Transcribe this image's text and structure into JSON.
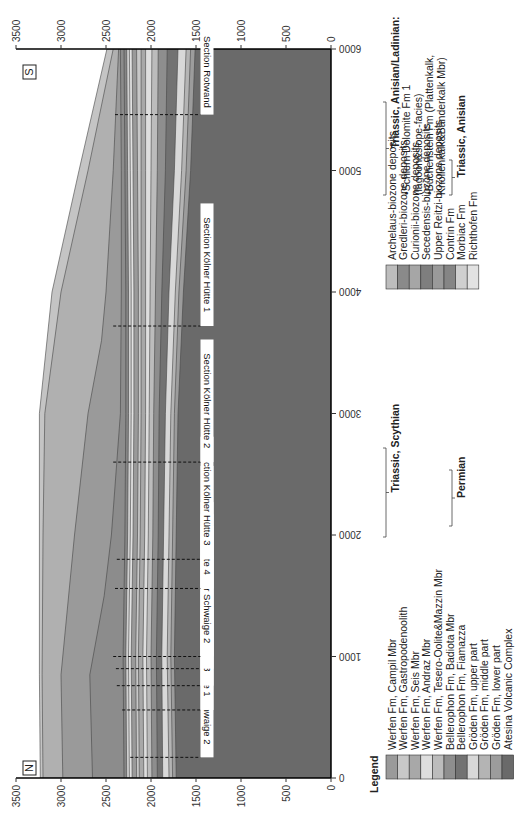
{
  "chart_data": {
    "type": "area",
    "title": "",
    "orientation": "rotated 90 degrees (figure printed sideways)",
    "xlabel": "",
    "ylabel": "",
    "x_axis": {
      "name": "distance",
      "range": [
        0,
        6000
      ],
      "ticks": [
        0,
        1000,
        2000,
        3000,
        4000,
        5000,
        6000
      ]
    },
    "y_axis": {
      "name": "elevation",
      "range": [
        0,
        3500
      ],
      "ticks": [
        0,
        500,
        1000,
        1500,
        2000,
        2500,
        3000,
        3500
      ]
    },
    "compass": {
      "left_end": "N",
      "right_end": "S"
    },
    "grid": false,
    "sections": [
      {
        "label": "Section Hanicker Schwaige 2",
        "x": 170,
        "top_elev": 2230
      },
      {
        "label": "Section Völsecker Schwaige 1",
        "x": 560,
        "top_elev": 2320
      },
      {
        "label": "Section Hanicker Schwaige 1/3",
        "x": 760,
        "top_elev": 2380
      },
      {
        "label": "Section Völsecker Schwaige 3",
        "x": 900,
        "top_elev": 2390
      },
      {
        "label": "Section Völsecker Schwaige 2",
        "x": 1000,
        "top_elev": 2420
      },
      {
        "label": "Section Kölner Hütte 4",
        "x": 1560,
        "top_elev": 2400
      },
      {
        "label": "Section Kölner Hütte 3",
        "x": 1800,
        "top_elev": 2380
      },
      {
        "label": "Section Kölner Hütte 2",
        "x": 2600,
        "top_elev": 2420
      },
      {
        "label": "Section Kölner Hütte 1",
        "x": 3720,
        "top_elev": 2420
      },
      {
        "label": "Section Rotwand",
        "x": 5460,
        "top_elev": 2400
      }
    ],
    "layers": [
      {
        "name": "Atesina Volcanic Complex",
        "top": [
          [
            0,
            1720
          ],
          [
            1000,
            1740
          ],
          [
            2000,
            1720
          ],
          [
            3000,
            1700
          ],
          [
            4000,
            1640
          ],
          [
            5000,
            1560
          ],
          [
            6000,
            1510
          ]
        ]
      },
      {
        "name": "Gröden Fm, lower part",
        "top": [
          [
            0,
            1760
          ],
          [
            1000,
            1780
          ],
          [
            2000,
            1760
          ],
          [
            3000,
            1740
          ],
          [
            4000,
            1690
          ],
          [
            5000,
            1610
          ],
          [
            6000,
            1560
          ]
        ]
      },
      {
        "name": "Gröden Fm, middle part",
        "top": [
          [
            0,
            1800
          ],
          [
            1000,
            1820
          ],
          [
            2000,
            1800
          ],
          [
            3000,
            1780
          ],
          [
            4000,
            1730
          ],
          [
            5000,
            1660
          ],
          [
            6000,
            1610
          ]
        ]
      },
      {
        "name": "Gröden Fm, upper part",
        "top": [
          [
            0,
            1870
          ],
          [
            1000,
            1880
          ],
          [
            2000,
            1860
          ],
          [
            3000,
            1840
          ],
          [
            4000,
            1800
          ],
          [
            5000,
            1740
          ],
          [
            6000,
            1700
          ]
        ]
      },
      {
        "name": "Bellerophon Fm, Fiamazza",
        "top": [
          [
            0,
            1930
          ],
          [
            1000,
            1940
          ],
          [
            2000,
            1920
          ],
          [
            3000,
            1910
          ],
          [
            4000,
            1880
          ],
          [
            5000,
            1840
          ],
          [
            6000,
            1820
          ]
        ]
      },
      {
        "name": "Bellerophon Fm, Badiota Mbr",
        "top": [
          [
            0,
            1990
          ],
          [
            1000,
            2000
          ],
          [
            2000,
            1980
          ],
          [
            3000,
            1970
          ],
          [
            4000,
            1950
          ],
          [
            5000,
            1930
          ],
          [
            6000,
            1920
          ]
        ]
      },
      {
        "name": "Werfen Fm, Tesero-Oolite&Mazzin Mbr",
        "top": [
          [
            0,
            2040
          ],
          [
            1000,
            2050
          ],
          [
            2000,
            2030
          ],
          [
            3000,
            2020
          ],
          [
            4000,
            2010
          ],
          [
            5000,
            2000
          ],
          [
            6000,
            1990
          ]
        ]
      },
      {
        "name": "Werfen Fm, Andraz Mbr",
        "top": [
          [
            0,
            2080
          ],
          [
            1000,
            2090
          ],
          [
            2000,
            2070
          ],
          [
            3000,
            2060
          ],
          [
            4000,
            2060
          ],
          [
            5000,
            2060
          ],
          [
            6000,
            2060
          ]
        ]
      },
      {
        "name": "Werfen Fm, Seis Mbr",
        "top": [
          [
            0,
            2130
          ],
          [
            1000,
            2140
          ],
          [
            2000,
            2120
          ],
          [
            3000,
            2110
          ],
          [
            4000,
            2110
          ],
          [
            5000,
            2110
          ],
          [
            6000,
            2110
          ]
        ]
      },
      {
        "name": "Werfen Fm, Gastropodenoolith",
        "top": [
          [
            0,
            2160
          ],
          [
            1000,
            2170
          ],
          [
            2000,
            2150
          ],
          [
            3000,
            2140
          ],
          [
            4000,
            2140
          ],
          [
            5000,
            2150
          ],
          [
            6000,
            2160
          ]
        ]
      },
      {
        "name": "Werfen Fm, Campil Mbr",
        "top": [
          [
            0,
            2210
          ],
          [
            1000,
            2220
          ],
          [
            2000,
            2200
          ],
          [
            3000,
            2190
          ],
          [
            4000,
            2190
          ],
          [
            5000,
            2200
          ],
          [
            6000,
            2210
          ]
        ]
      },
      {
        "name": "Richthofen Fm",
        "top": [
          [
            0,
            2240
          ],
          [
            1000,
            2250
          ],
          [
            2000,
            2230
          ],
          [
            3000,
            2220
          ],
          [
            4000,
            2220
          ],
          [
            5000,
            2230
          ],
          [
            6000,
            2240
          ]
        ]
      },
      {
        "name": "Morbiac Fm",
        "top": [
          [
            0,
            2270
          ],
          [
            1000,
            2280
          ],
          [
            2000,
            2260
          ],
          [
            3000,
            2250
          ],
          [
            4000,
            2250
          ],
          [
            5000,
            2260
          ],
          [
            6000,
            2270
          ]
        ]
      },
      {
        "name": "Contrin Fm",
        "top": [
          [
            0,
            2300
          ],
          [
            1000,
            2310
          ],
          [
            2000,
            2290
          ],
          [
            3000,
            2280
          ],
          [
            4000,
            2280
          ],
          [
            5000,
            2290
          ],
          [
            6000,
            2300
          ]
        ]
      },
      {
        "name": "Buchenstein Fm / Schlern Dolomite Fm 1",
        "top": [
          [
            0,
            2650
          ],
          [
            850,
            2680
          ],
          [
            1500,
            2520
          ],
          [
            2000,
            2440
          ],
          [
            3000,
            2340
          ],
          [
            4000,
            2330
          ],
          [
            5000,
            2330
          ],
          [
            6000,
            2340
          ]
        ]
      },
      {
        "name": "Upper Reitzi-biozone deposits",
        "top": [
          [
            0,
            2980
          ],
          [
            850,
            3000
          ],
          [
            2000,
            2850
          ],
          [
            3000,
            2700
          ],
          [
            3600,
            2550
          ],
          [
            4000,
            2500
          ],
          [
            5000,
            2420
          ],
          [
            6000,
            2360
          ]
        ]
      },
      {
        "name": "Secedensis-biozone deposits",
        "top": [
          [
            0,
            3200
          ],
          [
            850,
            3210
          ],
          [
            2000,
            3200
          ],
          [
            3000,
            3180
          ],
          [
            4000,
            3000
          ],
          [
            5000,
            2700
          ],
          [
            6000,
            2420
          ]
        ]
      },
      {
        "name": "Curionii / Gredleri / Archelaus-biozone deposits",
        "top": [
          [
            0,
            3230
          ],
          [
            850,
            3240
          ],
          [
            2000,
            3240
          ],
          [
            3000,
            3240
          ],
          [
            4000,
            3100
          ],
          [
            5000,
            2800
          ],
          [
            6000,
            2490
          ]
        ]
      }
    ],
    "legend": {
      "title": "Legend",
      "groups": [
        {
          "label": "Triassic, Anisian/Ladinian:",
          "bullets": [
            "Schlern Dolomite Fm 1 (lagoon&slope-facies)",
            "Buchenstein Fm (Plattenkalk, Knollenkalk&Bänderkalk Mbr)"
          ]
        },
        {
          "label": "Triassic, Anisian"
        },
        {
          "label": "Triassic, Scythian"
        },
        {
          "label": "Permian"
        }
      ],
      "entries": [
        "Werfen Fm, Campil Mbr",
        "Werfen Fm, Gastropodenoolith",
        "Werfen Fm, Seis Mbr",
        "Werfen Fm, Andraz Mbr",
        "Werfen Fm, Tesero-Oolite&Mazzin Mbr",
        "Bellerophon Fm, Badiota Mbr",
        "Bellerophon Fm, Fiamazza",
        "Gröden Fm, upper part",
        "Gröden Fm, middle part",
        "Gröden Fm, lower part",
        "Atesina Volcanic Complex",
        "Archelaus-biozone deposits",
        "Gredleri-biozone deposits",
        "Curionii-biozone deposits",
        "Secedensis-biozone deposits",
        "Upper Reitzi-biozone deposits",
        "Contrin Fm",
        "Morbiac Fm",
        "Richthofen Fm"
      ]
    }
  },
  "figure": {
    "compass_north": "N",
    "compass_south": "S",
    "legend_title": "Legend",
    "x_tick_labels": [
      "0",
      "1000",
      "2000",
      "3000",
      "4000",
      "5000",
      "6000"
    ],
    "y_tick_labels": [
      "0",
      "500",
      "1000",
      "1500",
      "2000",
      "2500",
      "3000",
      "3500"
    ],
    "legend_left": [
      {
        "label": "Werfen Fm, Campil Mbr",
        "color": "#9a9a9a"
      },
      {
        "label": "Werfen Fm, Gastropodenoolith",
        "color": "#c8c8c8"
      },
      {
        "label": "Werfen Fm, Seis Mbr",
        "color": "#a8a8a8"
      },
      {
        "label": "Werfen Fm, Andraz Mbr",
        "color": "#dedede"
      },
      {
        "label": "Werfen Fm, Tesero-Oolite&Mazzin Mbr",
        "color": "#bcbcbc"
      },
      {
        "label": "Bellerophon Fm, Badiota Mbr",
        "color": "#8e8e8e"
      },
      {
        "label": "Bellerophon Fm, Fiamazza",
        "color": "#727272"
      },
      {
        "label": "Gröden Fm, upper part",
        "color": "#d8d8d8"
      },
      {
        "label": "Gröden Fm, middle part",
        "color": "#b4b4b4"
      },
      {
        "label": "Gröden Fm, lower part",
        "color": "#9c9c9c"
      },
      {
        "label": "Atesina Volcanic Complex",
        "color": "#6a6a6a"
      }
    ],
    "legend_right": [
      {
        "label": "Archelaus-biozone deposits",
        "color": "#bdbdbd"
      },
      {
        "label": "Gredleri-biozone deposits",
        "color": "#8a8a8a"
      },
      {
        "label": "Curionii-biozone deposits",
        "color": "#a6a6a6"
      },
      {
        "label": "Secedensis-biozone deposits",
        "color": "#7e7e7e"
      },
      {
        "label": "Upper Reitzi-biozone deposits",
        "color": "#9a9a9a"
      },
      {
        "label": "Contrin Fm",
        "color": "#858585"
      },
      {
        "label": "Morbiac Fm",
        "color": "#cfcfcf"
      },
      {
        "label": "Richthofen Fm",
        "color": "#e2e2e2"
      }
    ],
    "group_labels": {
      "anisian_ladinian": "Triassic, Anisian/Ladinian:",
      "bullet1_line1": "•Schlern Dolomite Fm 1",
      "bullet1_line2": "(lagoon&slope-facies)",
      "bullet2_line1": "•Buchenstein Fm (Plattenkalk,",
      "bullet2_line2": "Knollenkalk&Bänderkalk Mbr)",
      "anisian": "Triassic, Anisian",
      "scythian": "Triassic, Scythian",
      "permian": "Permian"
    }
  }
}
